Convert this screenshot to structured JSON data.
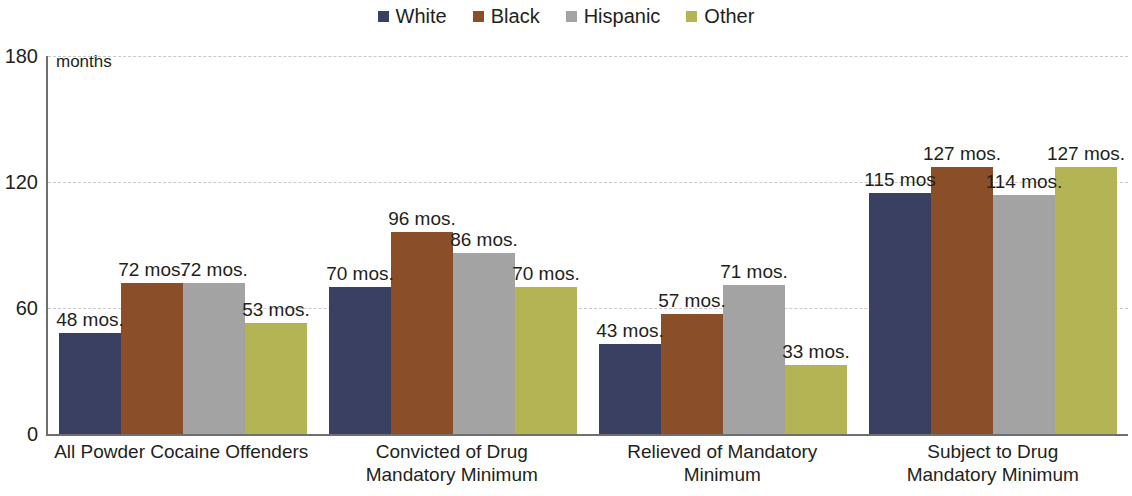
{
  "legend": {
    "items": [
      {
        "label": "White",
        "color": "#3a4062",
        "icon": "square-swatch-icon"
      },
      {
        "label": "Black",
        "color": "#8a4f28",
        "icon": "square-swatch-icon"
      },
      {
        "label": "Hispanic",
        "color": "#a3a3a3",
        "icon": "square-swatch-icon"
      },
      {
        "label": "Other",
        "color": "#b5b455",
        "icon": "square-swatch-icon"
      }
    ]
  },
  "axis": {
    "unit_label": "months",
    "yticks": [
      "0",
      "60",
      "120",
      "180"
    ]
  },
  "chart_data": {
    "type": "bar",
    "title": "",
    "xlabel": "",
    "ylabel": "months",
    "ylim": [
      0,
      180
    ],
    "yticks": [
      0,
      60,
      120,
      180
    ],
    "grid": true,
    "legend_position": "top-center",
    "categories": [
      "All Powder Cocaine Offenders",
      "Convicted of Drug Mandatory Minimum",
      "Relieved of Mandatory Minimum",
      "Subject to Drug Mandatory Minimum"
    ],
    "category_lines": [
      [
        "All Powder Cocaine Offenders"
      ],
      [
        "Convicted of Drug",
        "Mandatory Minimum"
      ],
      [
        "Relieved of Mandatory",
        "Minimum"
      ],
      [
        "Subject to Drug",
        "Mandatory Minimum"
      ]
    ],
    "series": [
      {
        "name": "White",
        "color": "#3a4062",
        "values": [
          48,
          70,
          43,
          115
        ],
        "labels": [
          "48 mos.",
          "70 mos.",
          "43 mos.",
          "115 mos"
        ]
      },
      {
        "name": "Black",
        "color": "#8a4f28",
        "values": [
          72,
          96,
          57,
          127
        ],
        "labels": [
          "72 mos.",
          "96 mos.",
          "57 mos.",
          "127 mos."
        ]
      },
      {
        "name": "Hispanic",
        "color": "#a3a3a3",
        "values": [
          72,
          86,
          71,
          114
        ],
        "labels": [
          "72 mos.",
          "86 mos.",
          "71 mos.",
          "114 mos."
        ]
      },
      {
        "name": "Other",
        "color": "#b5b455",
        "values": [
          53,
          70,
          33,
          127
        ],
        "labels": [
          "53 mos.",
          "70 mos.",
          "33 mos.",
          "127 mos."
        ]
      }
    ]
  }
}
